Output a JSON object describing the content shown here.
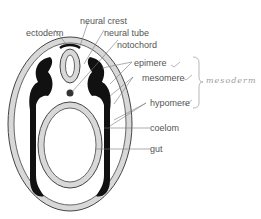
{
  "diagram": {
    "labels": {
      "ectoderm": "ectoderm",
      "neural_crest": "neural crest",
      "neural_tube": "neural tube",
      "notochord": "notochord",
      "epimere": "epimere",
      "mesomere": "mesomere",
      "hypomere": "hypomere",
      "coelom": "coelom",
      "gut": "gut"
    },
    "annotation": {
      "group_label": "mesoderm",
      "group_members": [
        "epimere",
        "mesomere",
        "hypomere"
      ]
    },
    "colors": {
      "outline": "#222222",
      "tissue_fill": "#d8d8d8",
      "mesoderm": "#111111",
      "label_text": "#555555",
      "annotation_text": "#9a9a9a"
    }
  }
}
